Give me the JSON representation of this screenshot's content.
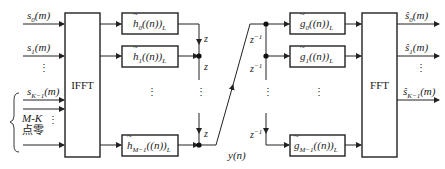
{
  "diagram": {
    "type": "filter-bank block diagram",
    "inputs": [
      "s_0(m)",
      "s_1(m)",
      "⋮",
      "s_K-1(m)"
    ],
    "zero_pad_label_line1": "M-K",
    "zero_pad_label_line2": "点零",
    "ifft_label": "IFFT",
    "fft_label": "FFT",
    "analysis_filters": [
      "h̃_0((n))_L",
      "h̃_1((n))_L",
      "⋮",
      "h̃_M-1((n))_L"
    ],
    "synthesis_filters": [
      "g̃_0((n))_L",
      "g̃_1((n))_L",
      "⋮",
      "g̃_M-1((n))_L"
    ],
    "delay_left": "z",
    "delay_right": "z^-1",
    "channel_signal": "y(n)",
    "outputs": [
      "ŝ_0(m)",
      "ŝ_1(m)",
      "⋮",
      "ŝ_K-1(m)"
    ]
  },
  "labels": {
    "s0": "s",
    "s0_sub": "0",
    "s1": "s",
    "s1_sub": "1",
    "sK": "s",
    "sK_sub": "K−1",
    "arg_m": "(m)",
    "h": "h",
    "h0_sub": "0",
    "h1_sub": "1",
    "hM_sub": "M−1",
    "filt_arg": "((n))",
    "filt_sub": "L",
    "g": "g",
    "g0_sub": "0",
    "g1_sub": "1",
    "gM_sub": "M−1",
    "z": "z",
    "zinv": "z",
    "zinv_sup": "−1",
    "y": "y(n)",
    "shat": "ŝ",
    "o0_sub": "0",
    "o1_sub": "1",
    "oK_sub": "K−1",
    "mk_m": "M",
    "mk_dash": "-",
    "mk_k": "K",
    "zero_text": "点零",
    "ifft": "IFFT",
    "fft": "FFT",
    "vdots": "⋮"
  }
}
